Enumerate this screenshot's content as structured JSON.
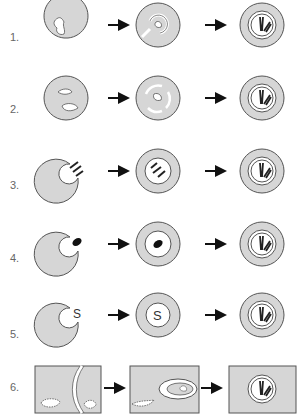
{
  "colors": {
    "fill": "#d6d6d6",
    "stroke": "#555555",
    "arrow": "#111111",
    "dark": "#222222",
    "white": "#ffffff"
  },
  "rows": [
    {
      "label": "1.",
      "y": 38
    },
    {
      "label": "2.",
      "y": 110
    },
    {
      "label": "3.",
      "y": 186
    },
    {
      "label": "4.",
      "y": 259
    },
    {
      "label": "5.",
      "y": 335
    },
    {
      "label": "6.",
      "y": 388
    }
  ],
  "stage_s_letter": "S"
}
